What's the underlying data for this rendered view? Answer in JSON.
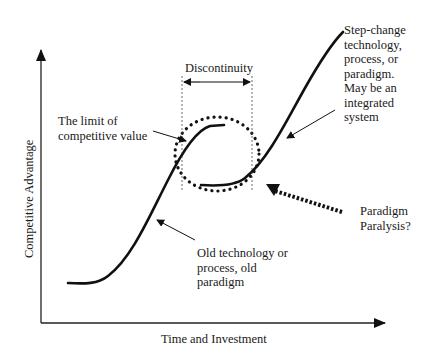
{
  "diagram": {
    "title": "",
    "axes": {
      "y_label": "Competitive Advantage",
      "x_label": "Time and Investment"
    },
    "labels": {
      "discontinuity": "Discontinuity",
      "limit": "The limit of\ncompetitive value",
      "step_change": "Step-change\ntechnology,\nprocess, or\nparadigm.\nMay be an\nintegrated\nsystem",
      "paralysis": "Paradigm\nParalysis?",
      "old_tech": "Old technology or\nprocess, old\nparadigm"
    },
    "curves": [
      {
        "name": "old-s-curve",
        "description": "Old technology S-curve reaching limit of competitive value"
      },
      {
        "name": "new-s-curve",
        "description": "Step-change technology S-curve"
      }
    ],
    "colors": {
      "line": "#111111",
      "text": "#1a1a1a",
      "background": "#ffffff"
    }
  }
}
